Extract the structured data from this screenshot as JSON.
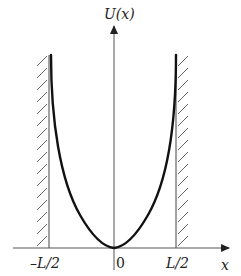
{
  "diagram": {
    "y_axis_label": "U(x)",
    "x_axis_label": "x",
    "tick_labels": {
      "left": "–L/2",
      "center": "0",
      "right": "L/2"
    },
    "elements": {
      "curve": "U-shaped potential with minimum at x=0, diverging toward walls",
      "walls": [
        "hatched wall at x=-L/2",
        "hatched wall at x=L/2"
      ]
    },
    "colors": {
      "curve": "#111111",
      "axis": "#555555",
      "hatch": "#444444"
    }
  }
}
